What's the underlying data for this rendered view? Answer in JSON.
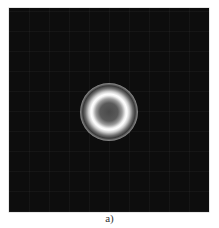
{
  "figure": {
    "caption": "a)",
    "panel": {
      "background_color": "#0d0d0d",
      "description": "Dark square image with a bright concentric ring pattern at center"
    },
    "ring": {
      "center_x_px": 109,
      "center_y_px": 112,
      "outer_radius_px": 29,
      "inner_bright_ring_color": "#ffffff",
      "outer_ring_color": "#8a8a8a"
    }
  }
}
